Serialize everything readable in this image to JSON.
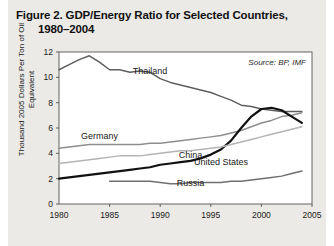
{
  "figure": {
    "title_line1": "Figure 2. GDP/Energy Ratio for Selected Countries,",
    "title_line2": "1980–2004",
    "source_note": "Source: BP, IMF",
    "ylabel": "Thousand 2005 Dollars Per Ton of Oil Equivalent"
  },
  "colors": {
    "page_background": "#eceae7",
    "plot_background": "#ffffff",
    "axis": "#555555",
    "china": "#111111",
    "thailand": "#5e5e5e",
    "germany": "#8e8e8e",
    "united_states": "#b4b4b4",
    "russia": "#6f6f6f",
    "text": "#1a1a1a"
  },
  "chart_data": {
    "type": "line",
    "title": "Figure 2. GDP/Energy Ratio for Selected Countries, 1980–2004",
    "xlabel": "",
    "ylabel": "Thousand 2005 Dollars Per Ton of Oil Equivalent",
    "xlim": [
      1980,
      2005
    ],
    "ylim": [
      0,
      12
    ],
    "xticks": [
      1980,
      1985,
      1990,
      1995,
      2000,
      2005
    ],
    "yticks": [
      0,
      2,
      4,
      6,
      8,
      10,
      12
    ],
    "xtick_labels": [
      "1980",
      "1985",
      "1990",
      "1995",
      "2000",
      "2005"
    ],
    "ytick_labels": [
      "0",
      "2",
      "4",
      "6",
      "8",
      "10",
      "12"
    ],
    "grid": false,
    "legend_position": "inline-labels",
    "annotations": [
      "Source: BP, IMF"
    ],
    "x": [
      1980,
      1981,
      1982,
      1983,
      1984,
      1985,
      1986,
      1987,
      1988,
      1989,
      1990,
      1991,
      1992,
      1993,
      1994,
      1995,
      1996,
      1997,
      1998,
      1999,
      2000,
      2001,
      2002,
      2003,
      2004
    ],
    "series": [
      {
        "name": "Thailand",
        "color": "#5e5e5e",
        "label_x": 1989,
        "label_y": 10.3,
        "values": [
          10.6,
          11.0,
          11.4,
          11.7,
          11.2,
          10.6,
          10.6,
          10.4,
          10.5,
          10.4,
          9.9,
          9.6,
          9.4,
          9.2,
          9.0,
          8.8,
          8.5,
          8.2,
          7.8,
          7.7,
          7.5,
          7.4,
          7.3,
          7.3,
          7.3
        ]
      },
      {
        "name": "Germany",
        "color": "#8e8e8e",
        "label_x": 1984,
        "label_y": 5.1,
        "values": [
          4.4,
          4.5,
          4.6,
          4.7,
          4.7,
          4.7,
          4.7,
          4.7,
          4.7,
          4.8,
          4.8,
          4.9,
          5.0,
          5.1,
          5.2,
          5.3,
          5.4,
          5.6,
          5.8,
          6.1,
          6.4,
          6.6,
          6.9,
          7.0,
          7.2
        ]
      },
      {
        "name": "China",
        "color": "#111111",
        "label_x": 1993,
        "label_y": 3.6,
        "values": [
          2.0,
          2.1,
          2.2,
          2.3,
          2.4,
          2.5,
          2.6,
          2.7,
          2.8,
          2.9,
          3.1,
          3.2,
          3.3,
          3.4,
          3.6,
          3.9,
          4.3,
          5.0,
          6.0,
          6.9,
          7.5,
          7.6,
          7.4,
          6.9,
          6.4
        ]
      },
      {
        "name": "United States",
        "color": "#b4b4b4",
        "label_x": 1996,
        "label_y": 3.1,
        "values": [
          3.2,
          3.3,
          3.4,
          3.5,
          3.6,
          3.7,
          3.8,
          3.8,
          3.8,
          3.9,
          4.0,
          4.1,
          4.2,
          4.2,
          4.3,
          4.4,
          4.5,
          4.7,
          4.9,
          5.1,
          5.3,
          5.5,
          5.7,
          5.9,
          6.1
        ]
      },
      {
        "name": "Russia",
        "color": "#6f6f6f",
        "label_x": 1993,
        "label_y": 1.45,
        "values": [
          null,
          null,
          null,
          null,
          null,
          1.8,
          1.8,
          1.8,
          1.8,
          1.8,
          1.7,
          1.6,
          1.6,
          1.7,
          1.7,
          1.7,
          1.7,
          1.8,
          1.8,
          1.9,
          2.0,
          2.1,
          2.2,
          2.4,
          2.6
        ]
      }
    ]
  }
}
